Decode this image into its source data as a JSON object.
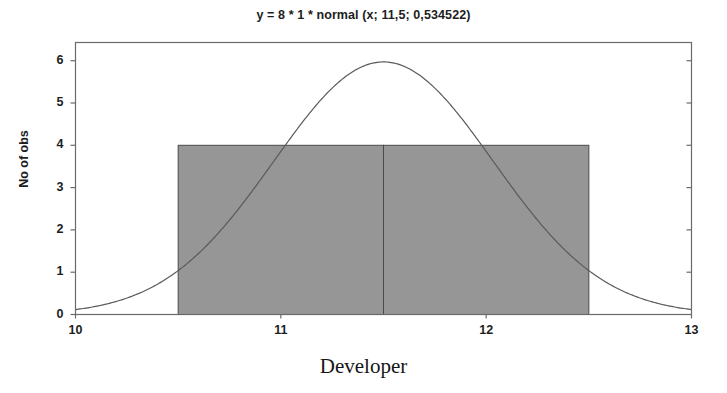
{
  "chart_data": {
    "type": "bar",
    "title": "y = 8 * 1 * normal (x; 11,5; 0,534522)",
    "xlabel": "Developer",
    "ylabel": "No of obs",
    "xlim": [
      10,
      13
    ],
    "ylim": [
      0,
      6.43
    ],
    "grid": false,
    "legend": "none",
    "xticks": [
      "10",
      "11",
      "12",
      "13"
    ],
    "xtick_values": [
      10,
      11,
      12,
      13
    ],
    "yticks": [
      "0",
      "1",
      "2",
      "3",
      "4",
      "5",
      "6"
    ],
    "ytick_values": [
      0,
      1,
      2,
      3,
      4,
      5,
      6
    ],
    "bin_edges": [
      10.5,
      11.5,
      12.5
    ],
    "categories": [
      "10,5 - 11,5",
      "11,5 - 12,5"
    ],
    "values": [
      4,
      4
    ],
    "bar_color": "#969696",
    "bar_edge_color": "#4a4a4a",
    "curve_color": "#5a5a5a",
    "axis_color": "#6a6a6a",
    "background": "#ffffff",
    "overlay": {
      "type": "line",
      "name": "normal (x; 11,5; 0,534522)",
      "scale": 8,
      "bin_width": 1,
      "mean": 11.5,
      "sd": 0.534522,
      "peak_value": 5.97,
      "x": [
        10.0,
        10.1,
        10.2,
        10.3,
        10.4,
        10.5,
        10.6,
        10.7,
        10.8,
        10.9,
        11.0,
        11.1,
        11.2,
        11.3,
        11.4,
        11.5,
        11.6,
        11.7,
        11.8,
        11.9,
        12.0,
        12.1,
        12.2,
        12.3,
        12.4,
        12.5,
        12.6,
        12.7,
        12.8,
        12.9,
        13.0
      ],
      "y": [
        0.09,
        0.17,
        0.29,
        0.49,
        0.78,
        1.21,
        1.79,
        2.54,
        3.44,
        4.43,
        5.4,
        6.0,
        5.97,
        5.4,
        4.43,
        5.97,
        5.4,
        4.43,
        3.44,
        2.54,
        1.79,
        1.21,
        0.78,
        0.49,
        0.29,
        0.17,
        0.09,
        0.05,
        0.02,
        0.01,
        0.0
      ]
    }
  }
}
